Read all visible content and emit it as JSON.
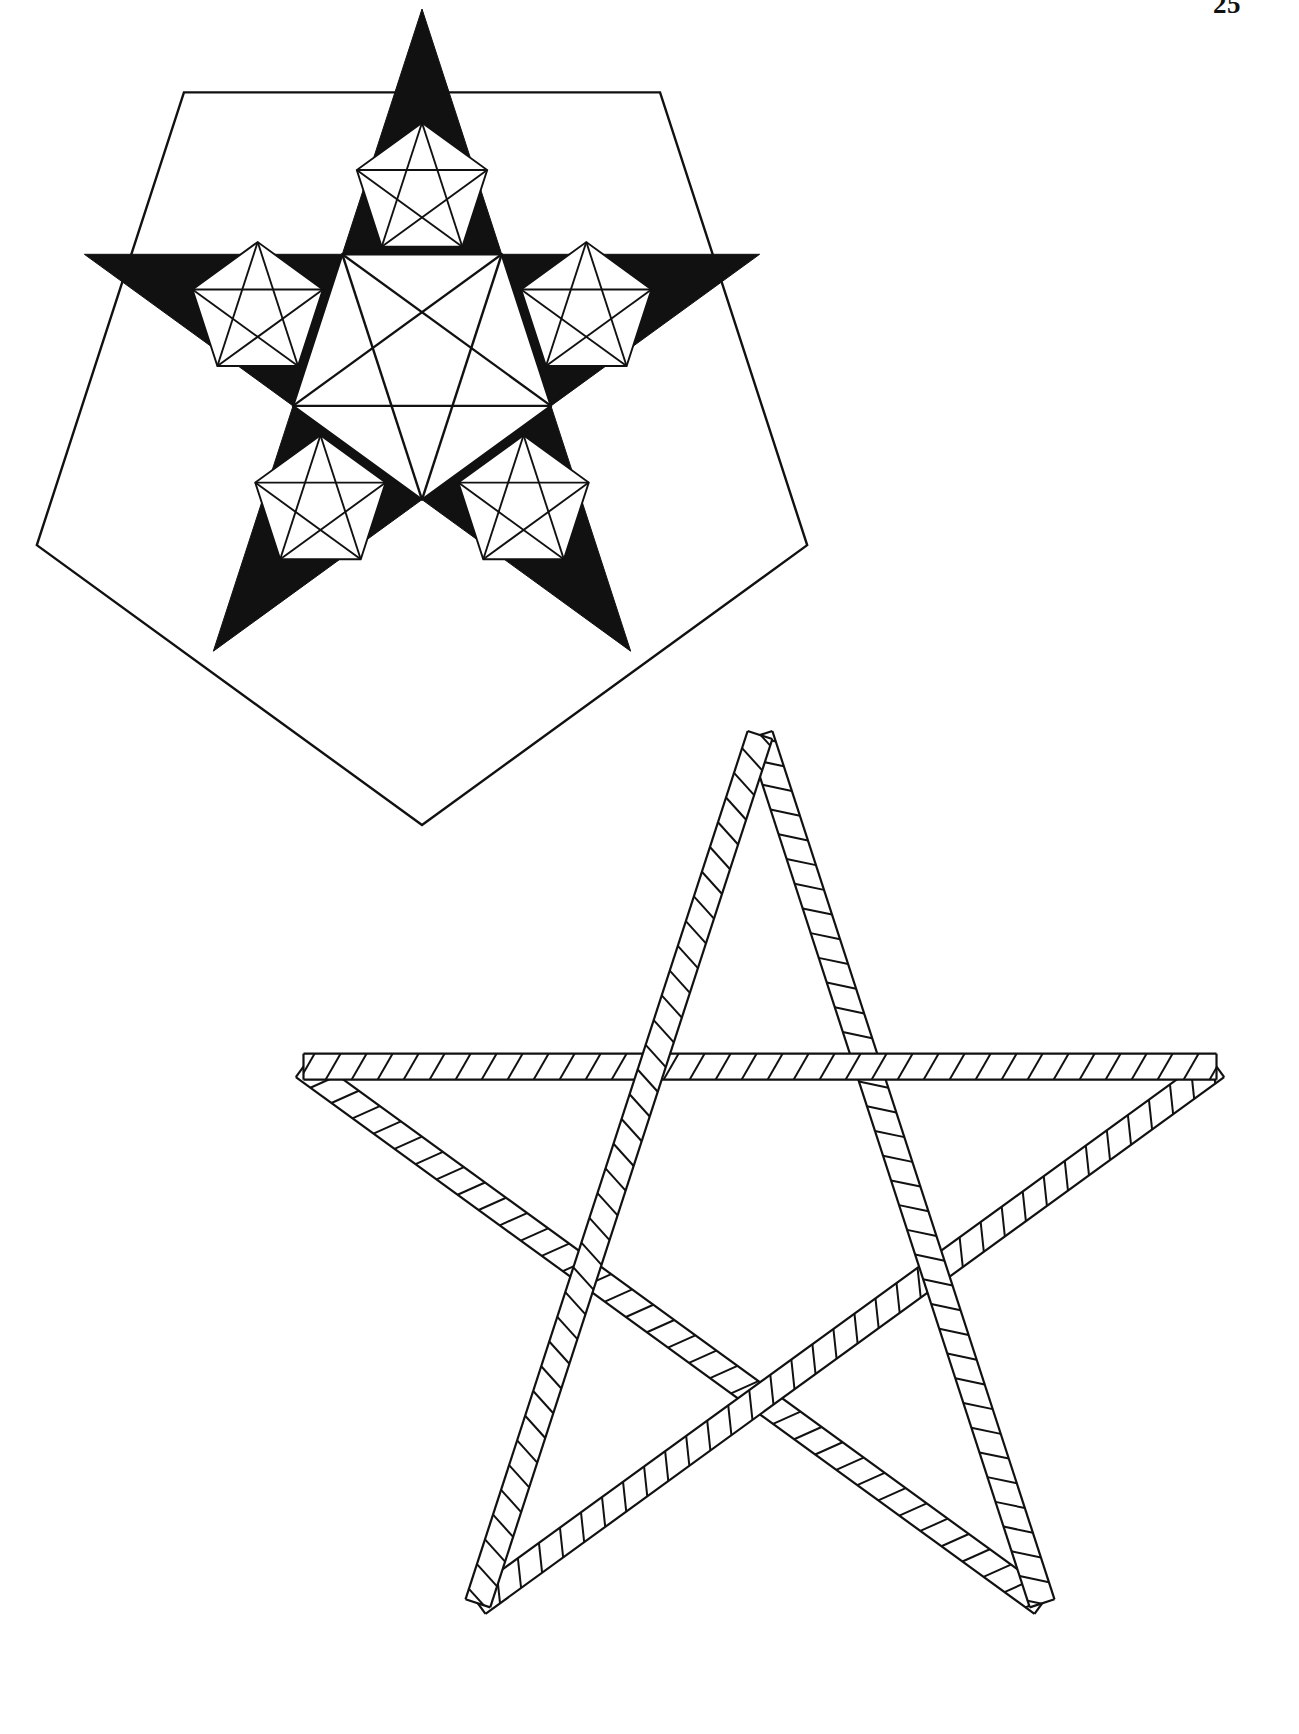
{
  "page": {
    "folio": "25",
    "width": 1299,
    "height": 1734,
    "background_color": "#ffffff",
    "ink_color": "#111111"
  },
  "figures": [
    {
      "id": "fig-pentagon-fractal-pentagram",
      "name": "pentagon-with-fractal-pentagram",
      "caption": "",
      "description": "Regular pentagon enclosing an inscribed pentagram whose five point-triangles are solid black, each point containing a smaller white pentagon with its own inscribed pentagram; the central pentagon is white with a pentagram drawn in outline.",
      "fill": "solid-black-star-points",
      "stroke_color": "#111111",
      "stroke_width": 2.4,
      "outer_pentagon": {
        "center_x": 422,
        "center_y": 420,
        "circumradius": 405,
        "rotation_deg": 180,
        "vertex_count": 5
      },
      "inner_pentagram": {
        "center_x": 422,
        "center_y": 364,
        "circumradius": 355,
        "rotation_deg": 0,
        "point_count": 5,
        "points_filled": true
      },
      "sub_pentagon_count": 5,
      "sub_pentagram_count": 5,
      "center_pentagram": true
    },
    {
      "id": "fig-woven-band-pentagram",
      "name": "woven-band-pentagram",
      "caption": "",
      "description": "Large five-pointed star drawn as a continuous plaited ribbon: two parallel outlines forming a band, filled with repeating diagonal hatch strokes, the band interlacing over and under itself at each crossing.",
      "stroke_color": "#111111",
      "stroke_width": 2.2,
      "hatch_stroke_width": 2.0,
      "band_half_width": 13,
      "hatch_spacing": 26,
      "pentagram": {
        "center_x": 760,
        "center_y": 1215,
        "circumradius": 480,
        "rotation_deg": 0,
        "point_count": 5
      }
    }
  ]
}
